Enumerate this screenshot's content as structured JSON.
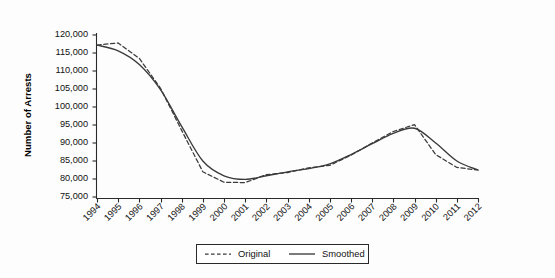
{
  "chart_data": {
    "type": "line",
    "title": "",
    "xlabel": "",
    "ylabel": "Number of Arrests",
    "ylim": [
      75000,
      120000
    ],
    "ytick_step": 5000,
    "grid": false,
    "legend_position": "bottom-center",
    "categories": [
      "1994",
      "1995",
      "1996",
      "1997",
      "1998",
      "1999",
      "2000",
      "2001",
      "2002",
      "2003",
      "2004",
      "2005",
      "2006",
      "2007",
      "2008",
      "2009",
      "2010",
      "2011",
      "2012"
    ],
    "x": [
      1994,
      1995,
      1996,
      1997,
      1998,
      1999,
      2000,
      2001,
      2002,
      2003,
      2004,
      2005,
      2006,
      2007,
      2008,
      2009,
      2010,
      2011,
      2012
    ],
    "yticks": [
      "75,000",
      "80,000",
      "85,000",
      "90,000",
      "95,000",
      "100,000",
      "105,000",
      "110,000",
      "115,000",
      "120,000"
    ],
    "ytick_values": [
      75000,
      80000,
      85000,
      90000,
      95000,
      100000,
      105000,
      110000,
      115000,
      120000
    ],
    "series": [
      {
        "name": "Original",
        "style": "dashed",
        "color": "#3a3a3a",
        "values": [
          117200,
          117800,
          113500,
          105200,
          93500,
          82000,
          79100,
          79000,
          81200,
          81800,
          83100,
          83800,
          86600,
          90000,
          93200,
          95100,
          86800,
          83200,
          82500
        ]
      },
      {
        "name": "Smoothed",
        "style": "solid",
        "color": "#3a3a3a",
        "values": [
          117200,
          115600,
          111800,
          104800,
          94600,
          85000,
          80900,
          79900,
          80900,
          82000,
          82900,
          84200,
          86800,
          89800,
          92700,
          94100,
          90000,
          85000,
          82500
        ]
      }
    ]
  },
  "legend": {
    "entries": [
      {
        "label": "Original",
        "style": "dashed"
      },
      {
        "label": "Smoothed",
        "style": "solid"
      }
    ]
  },
  "axes": {
    "y_title": "Number of Arrests"
  }
}
